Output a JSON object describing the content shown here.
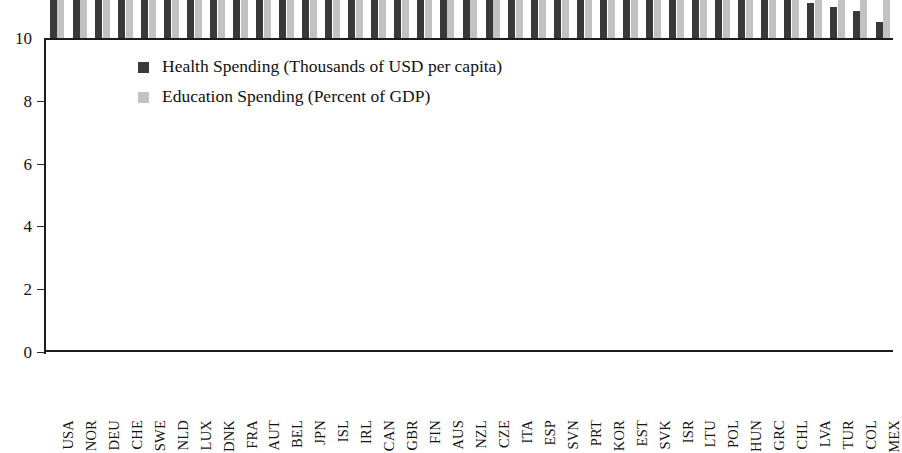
{
  "chart_data": {
    "type": "bar",
    "title": "",
    "subtitle": "",
    "xlabel": "",
    "ylabel": "",
    "ylim": [
      0,
      10
    ],
    "yticks": [
      0,
      2,
      4,
      6,
      8,
      10
    ],
    "ytick_labels": [
      "0",
      "2",
      "4",
      "6",
      "8",
      "10"
    ],
    "grid": false,
    "legend_position": "upper-left-inside",
    "orientation": "vertical",
    "bar_mode": "grouped",
    "categories": [
      "USA",
      "NOR",
      "DEU",
      "CHE",
      "SWE",
      "NLD",
      "LUX",
      "DNK",
      "FRA",
      "AUT",
      "BEL",
      "JPN",
      "ISL",
      "IRL",
      "CAN",
      "GBR",
      "FIN",
      "AUS",
      "NZL",
      "CZE",
      "ITA",
      "ESP",
      "SVN",
      "PRT",
      "KOR",
      "EST",
      "SVK",
      "ISR",
      "LTU",
      "POL",
      "HUN",
      "GRC",
      "CHL",
      "LVA",
      "TUR",
      "COL",
      "MEX"
    ],
    "series": [
      {
        "name": "Health Spending (Thousands of USD per capita)",
        "color": "#393939",
        "values": [
          9.3,
          5.75,
          5.72,
          5.05,
          5.0,
          4.85,
          4.72,
          4.7,
          4.55,
          4.5,
          4.15,
          4.1,
          4.05,
          3.95,
          3.8,
          3.7,
          3.6,
          3.5,
          3.35,
          3.0,
          2.75,
          2.6,
          2.35,
          2.1,
          2.05,
          1.95,
          1.9,
          1.9,
          1.75,
          1.62,
          1.55,
          1.42,
          1.22,
          1.12,
          1.0,
          0.85,
          0.5
        ]
      },
      {
        "name": "Education Spending (Percent of GDP)",
        "color": "#c2c2c2",
        "values": [
          4.15,
          6.3,
          3.6,
          5.05,
          5.0,
          4.35,
          3.3,
          4.6,
          4.55,
          4.4,
          5.35,
          2.95,
          5.45,
          3.1,
          4.35,
          4.3,
          5.55,
          3.95,
          4.7,
          2.9,
          3.3,
          3.35,
          3.45,
          4.15,
          3.4,
          4.1,
          4.0,
          3.8,
          4.85,
          3.4,
          4.0,
          3.2,
          3.8,
          4.3,
          3.65,
          3.8,
          4.25
        ]
      }
    ]
  },
  "legend": {
    "items": [
      {
        "label": "Health Spending (Thousands of USD per capita)",
        "swatch": "health"
      },
      {
        "label": "Education Spending (Percent of GDP)",
        "swatch": "education"
      }
    ]
  }
}
